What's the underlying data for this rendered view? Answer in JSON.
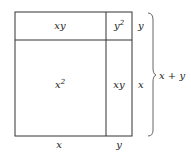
{
  "diagram": {
    "regions": [
      {
        "id": "top-left",
        "label": "xy"
      },
      {
        "id": "top-right",
        "label": "y",
        "exponent": "2"
      },
      {
        "id": "bottom-left",
        "label": "x",
        "exponent": "2"
      },
      {
        "id": "bottom-right",
        "label": "xy"
      }
    ],
    "side_labels": {
      "right_top": "y",
      "right_bottom": "x",
      "bottom_left": "x",
      "bottom_right": "y"
    },
    "brace_label": "x + y",
    "colors": {
      "stroke": "#333333",
      "text": "#222222",
      "background": "#ffffff"
    }
  }
}
